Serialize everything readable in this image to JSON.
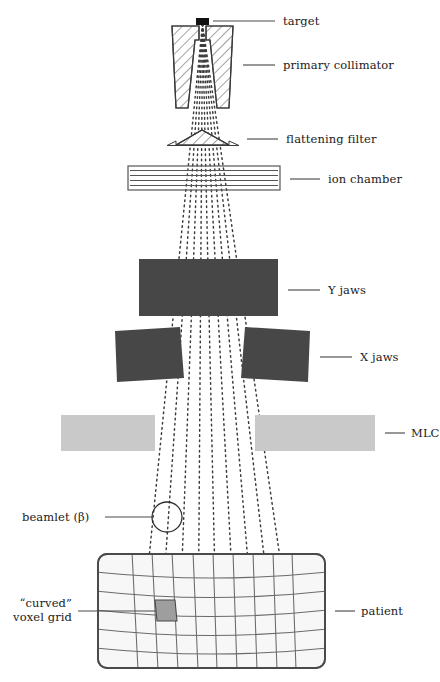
{
  "figure": {
    "domain": "diagram",
    "background_color": "#ffffff",
    "ink_color": "#1a1a1a"
  },
  "colors": {
    "ray_dots": "#3c3c3c",
    "jaws_dark": "#474747",
    "mlc_gray": "#c9c9c9",
    "target_black": "#111111",
    "voxel_fill": "#9e9e9e",
    "patient_fill": "#f7f7f7",
    "patient_stroke": "#4a4a4a",
    "hatch_stroke": "#555555"
  },
  "labels": [
    {
      "id": "target",
      "text": "target",
      "leader": true
    },
    {
      "id": "primary-collimator",
      "text": "primary collimator",
      "leader": true
    },
    {
      "id": "flattening-filter",
      "text": "flattening filter",
      "leader": true
    },
    {
      "id": "ion-chamber",
      "text": "ion chamber",
      "leader": true
    },
    {
      "id": "y-jaws",
      "text": "Y jaws",
      "leader": true
    },
    {
      "id": "x-jaws",
      "text": "X jaws",
      "leader": true
    },
    {
      "id": "mlc",
      "text": "MLC",
      "leader": true
    },
    {
      "id": "beamlet",
      "text": "beamlet (β)",
      "leader": true
    },
    {
      "id": "patient",
      "text": "patient",
      "leader": true
    },
    {
      "id": "voxel-grid-line1",
      "text": "“curved”",
      "leader": true
    },
    {
      "id": "voxel-grid-line2",
      "text": "voxel grid",
      "leader": false
    }
  ],
  "components": {
    "target": {
      "label": "target",
      "shape": "filled-rectangle",
      "x": 196,
      "y": 18,
      "w": 13,
      "h": 7
    },
    "primary_collimator": {
      "label": "primary collimator",
      "shape": "hatched-wedge-pair",
      "top": 26,
      "bottom": 108
    },
    "flattening_filter": {
      "label": "flattening filter",
      "shape": "hatched-flat-cone",
      "top": 130,
      "bottom": 146
    },
    "ion_chamber": {
      "label": "ion chamber",
      "shape": "lined-rectangle",
      "x": 128,
      "y": 166,
      "w": 152,
      "h": 24,
      "inner_lines": 4
    },
    "y_jaws": {
      "label": "Y jaws",
      "shape": "solid-rectangle",
      "x": 139,
      "y": 259,
      "w": 139,
      "h": 57
    },
    "x_jaws": {
      "label": "X jaws",
      "shape": "tilted-quad-pair",
      "top": 327,
      "bottom": 382
    },
    "mlc": {
      "label": "MLC",
      "shape": "gray-bar-pair",
      "y": 415,
      "h": 36,
      "gap_left": 155,
      "gap_right": 255
    },
    "beamlet": {
      "label": "beamlet (β)",
      "shape": "circle",
      "cx": 167,
      "cy": 517,
      "r": 15
    },
    "patient": {
      "label": "patient",
      "shape": "rounded-rect",
      "x": 98,
      "y": 554,
      "w": 227,
      "h": 114,
      "rx": 9
    },
    "voxel": {
      "label": "“curved” voxel grid",
      "shape": "highlighted-cell",
      "cx": 165,
      "cy": 610
    }
  },
  "beam": {
    "ray_count": 9,
    "source_x": 202.5,
    "source_y": 24,
    "style": "dotted",
    "spread_at_patient_left": 138,
    "spread_at_patient_right": 296
  },
  "grid": {
    "rows": 6,
    "columns": 9,
    "description": "curved voxel grid inside patient outline"
  }
}
